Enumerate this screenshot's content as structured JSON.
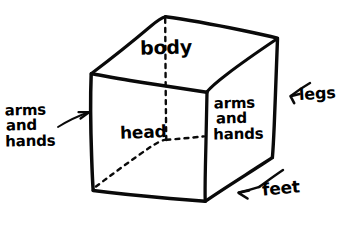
{
  "diagram": {
    "style": "hand-drawn ink sketch on white paper",
    "ink_color": "#000000",
    "paper_color": "#ffffff",
    "labels": {
      "top_face": "body",
      "front_face": "head",
      "right_face_line1": "arms",
      "right_face_line2": "and",
      "right_face_line3": "hands",
      "left_external_line1": "arms",
      "left_external_line2": "and",
      "left_external_line3": "hands",
      "right_external": "legs",
      "bottom_external": "feet"
    },
    "annotations": [
      {
        "name": "arms-and-hands-left",
        "text": "arms and hands",
        "arrow": "points right toward cube left edge"
      },
      {
        "name": "legs-right",
        "text": "legs",
        "arrow": "points left toward cube right edge"
      },
      {
        "name": "feet-bottom",
        "text": "feet",
        "arrow": "points left along cube bottom-right edge"
      }
    ],
    "geometry": {
      "shape": "cube in two-point perspective",
      "visible_faces": [
        "top",
        "front",
        "right"
      ],
      "hidden_edges": "three dashed lines converging at rear-lower-left vertex",
      "vertices": {
        "top_back": [
          165,
          17
        ],
        "top_left": [
          91,
          73
        ],
        "top_right": [
          277,
          38
        ],
        "top_front": [
          207,
          92
        ],
        "front_top_left": [
          91,
          73
        ],
        "front_bot_left": [
          93,
          190
        ],
        "front_bot_right": [
          205,
          201
        ],
        "right_bot": [
          272,
          157
        ],
        "hidden_vertex": [
          166,
          140
        ]
      }
    }
  }
}
